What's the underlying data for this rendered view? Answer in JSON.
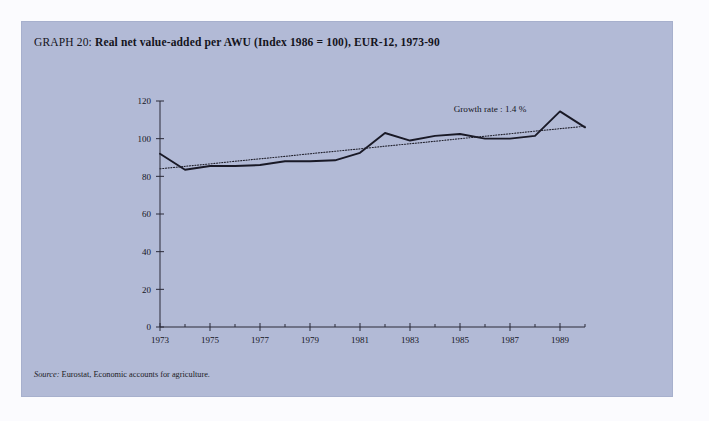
{
  "figure": {
    "graph_label": "GRAPH 20:",
    "title": "Real net value-added per AWU (Index 1986 = 100), EUR-12, 1973-90",
    "source_word": "Source:",
    "source_text": "Eurostat, Economic accounts for agriculture.",
    "panel_color": "#b2bad6",
    "page_color": "#fbfbfe",
    "ink_color": "#191926"
  },
  "chart_data": {
    "type": "line",
    "title": "Real net value-added per AWU (Index 1986 = 100), EUR-12, 1973-90",
    "xlabel": "",
    "ylabel": "",
    "xlim": [
      1973,
      1990
    ],
    "ylim": [
      0,
      120
    ],
    "yticks": [
      0,
      20,
      40,
      60,
      80,
      100,
      120
    ],
    "ytick_labels": [
      "0",
      "20",
      "40",
      "60",
      "80",
      "100",
      "120"
    ],
    "xticks": [
      1973,
      1975,
      1977,
      1979,
      1981,
      1983,
      1985,
      1987,
      1989
    ],
    "xtick_labels": [
      "1973",
      "1975",
      "1977",
      "1979",
      "1981",
      "1983",
      "1985",
      "1987",
      "1989"
    ],
    "xticks_minor": [
      1974,
      1976,
      1978,
      1980,
      1982,
      1984,
      1986,
      1988,
      1990
    ],
    "grid": false,
    "legend": false,
    "x": [
      1973,
      1974,
      1975,
      1976,
      1977,
      1978,
      1979,
      1980,
      1981,
      1982,
      1983,
      1984,
      1985,
      1986,
      1987,
      1988,
      1989,
      1990
    ],
    "series": [
      {
        "name": "Real net value-added per AWU (Index 1986 = 100)",
        "style": "solid",
        "values": [
          92,
          83.5,
          85.5,
          85.5,
          86,
          88,
          88,
          88.5,
          92.5,
          103,
          99,
          101.5,
          102.5,
          100,
          100,
          101.5,
          114.5,
          106
        ]
      },
      {
        "name": "Trend (growth rate 1.4 %)",
        "style": "dotted",
        "values": [
          84,
          85.3,
          86.6,
          88,
          89.3,
          90.6,
          92,
          93.3,
          94.6,
          96,
          97.3,
          98.6,
          100,
          101.3,
          102.6,
          104,
          105.3,
          106.6
        ]
      }
    ],
    "annotations": [
      {
        "name": "growth-rate-annotation",
        "text": "Growth rate : 1.4 %",
        "x": 1986.2,
        "y": 114
      }
    ]
  }
}
